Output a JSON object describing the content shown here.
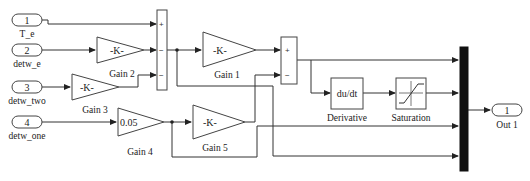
{
  "diagram": {
    "type": "simulink-block-diagram",
    "inports": [
      {
        "number": "1",
        "label": "T_e"
      },
      {
        "number": "2",
        "label": "detw_e"
      },
      {
        "number": "3",
        "label": "detw_two"
      },
      {
        "number": "4",
        "label": "detw_one"
      }
    ],
    "outports": [
      {
        "number": "1",
        "label": "Out 1"
      }
    ],
    "gains": [
      {
        "name": "Gain 1",
        "value": "-K-"
      },
      {
        "name": "Gain 2",
        "value": "-K-"
      },
      {
        "name": "Gain 3",
        "value": "-K-"
      },
      {
        "name": "Gain 4",
        "value": "0.05"
      },
      {
        "name": "Gain 5",
        "value": "-K-"
      }
    ],
    "sum1": {
      "signs": [
        "+",
        "−",
        "−"
      ]
    },
    "sum2": {
      "signs": [
        "+",
        "−"
      ]
    },
    "derivative": {
      "name": "Derivative",
      "text": "du/dt"
    },
    "saturation": {
      "name": "Saturation"
    },
    "mux": {
      "inputs": 4
    }
  }
}
